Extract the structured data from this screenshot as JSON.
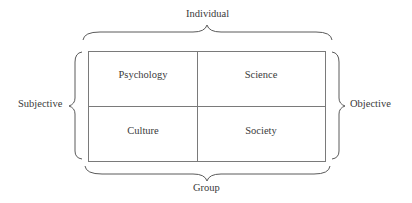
{
  "diagram": {
    "type": "2x2 quadrant matrix with brace-grouped axes",
    "axes": {
      "top": "Individual",
      "bottom": "Group",
      "left": "Subjective",
      "right": "Objective"
    },
    "quadrants": [
      {
        "position": "top-left",
        "label": "Psychology"
      },
      {
        "position": "top-right",
        "label": "Science"
      },
      {
        "position": "bottom-left",
        "label": "Culture"
      },
      {
        "position": "bottom-right",
        "label": "Society"
      }
    ],
    "colors": {
      "line": "#7a7a7a",
      "text": "#3a3a3a",
      "background": "#ffffff"
    }
  }
}
